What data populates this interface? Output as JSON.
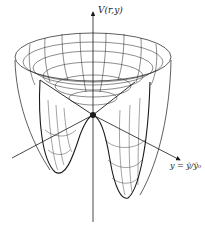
{
  "diagram": {
    "vertical_axis_label": "V(r,y)",
    "horizontal_axis_label": "y = ŷ/ŷ₀",
    "colors": {
      "ink": "#1a1a1a",
      "background": "#ffffff"
    },
    "geometry": {
      "center": [
        93,
        115
      ],
      "rim_center": [
        93,
        57
      ],
      "rim_rx": 78,
      "rim_ry": 24,
      "left_well_bottom": [
        58,
        173
      ],
      "right_well_bottom": [
        125,
        198
      ],
      "vertical_axis": {
        "x": 93,
        "y_top": 12,
        "y_bottom": 222
      },
      "y_axis": {
        "from": [
          12,
          158
        ],
        "to": [
          180,
          160
        ]
      }
    }
  }
}
